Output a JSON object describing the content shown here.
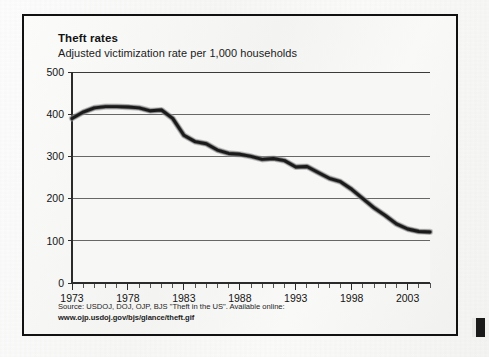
{
  "figure": {
    "title": "Theft rates",
    "subtitle": "Adjusted victimization rate per 1,000 households",
    "source_line_1": "Source: USDOJ, DOJ, OJP, BJS \"Theft in the US\". Available online:",
    "source_line_2": "www.ojp.usdoj.gov/bjs/glance/theft.gif",
    "border_color": "#111111",
    "line_color": "#1a1a1a",
    "grid_color": "#4a4a4a",
    "background_color": "#f6f6f5"
  },
  "chart_data": {
    "type": "line",
    "title": "Theft rates",
    "subtitle": "Adjusted victimization rate per 1,000 households",
    "xlabel": "",
    "ylabel": "",
    "xlim": [
      1973,
      2005
    ],
    "ylim": [
      0,
      500
    ],
    "ytick_labels": [
      "0",
      "100",
      "200",
      "300",
      "400",
      "500"
    ],
    "ytick_values": [
      0,
      100,
      200,
      300,
      400,
      500
    ],
    "ytick_step": 100,
    "xtick_labels": [
      "1973",
      "1978",
      "1983",
      "1988",
      "1993",
      "1998",
      "2003"
    ],
    "xtick_values": [
      1973,
      1978,
      1983,
      1988,
      1993,
      1998,
      2003
    ],
    "xtick_minor_step": 1,
    "grid": "horizontal",
    "legend": "none",
    "series": [
      {
        "name": "Adjusted victimization rate per 1,000 households",
        "x": [
          1973,
          1974,
          1975,
          1976,
          1977,
          1978,
          1979,
          1980,
          1981,
          1982,
          1983,
          1984,
          1985,
          1986,
          1987,
          1988,
          1989,
          1990,
          1991,
          1992,
          1993,
          1994,
          1995,
          1996,
          1997,
          1998,
          1999,
          2000,
          2001,
          2002,
          2003,
          2004,
          2005
        ],
        "values": [
          390,
          405,
          415,
          418,
          418,
          417,
          415,
          408,
          410,
          390,
          350,
          335,
          330,
          315,
          307,
          305,
          300,
          293,
          295,
          290,
          275,
          276,
          262,
          248,
          240,
          222,
          200,
          178,
          160,
          140,
          128,
          122,
          121
        ]
      }
    ]
  }
}
